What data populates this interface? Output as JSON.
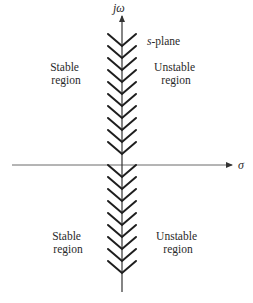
{
  "diagram": {
    "type": "s-plane stability regions",
    "plane_label_var": "s",
    "plane_label_rest": "-plane",
    "vertical_axis_label": "jω",
    "horizontal_axis_label": "σ",
    "regions": {
      "upper_left": [
        "Stable",
        "region"
      ],
      "upper_right": [
        "Unstable",
        "region"
      ],
      "lower_left": [
        "Stable",
        "region"
      ],
      "lower_right": [
        "Unstable",
        "region"
      ]
    },
    "colors": {
      "axis": "#6a6a6a",
      "hatch": "#1e1e1e",
      "text": "#2a2a2a",
      "background": "#ffffff"
    }
  }
}
